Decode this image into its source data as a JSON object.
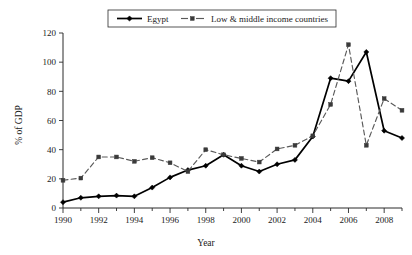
{
  "chart_data": {
    "type": "line",
    "title": "",
    "xlabel": "Year",
    "ylabel": "% of GDP",
    "xlim": [
      1990,
      2009
    ],
    "ylim": [
      0,
      120
    ],
    "ytick_step": 20,
    "yticks": [
      0,
      20,
      40,
      60,
      80,
      100,
      120
    ],
    "xticks": [
      1990,
      1991,
      1992,
      1993,
      1994,
      1995,
      1996,
      1997,
      1998,
      1999,
      2000,
      2001,
      2002,
      2003,
      2004,
      2005,
      2006,
      2007,
      2008,
      2009
    ],
    "xtick_labels": [
      "1990",
      "",
      "1992",
      "",
      "1994",
      "",
      "1996",
      "",
      "1998",
      "",
      "2000",
      "",
      "2002",
      "",
      "2004",
      "",
      "2006",
      "",
      "2008",
      ""
    ],
    "grid": false,
    "legend_position": "top-center",
    "x": [
      1990,
      1991,
      1992,
      1993,
      1994,
      1995,
      1996,
      1997,
      1998,
      1999,
      2000,
      2001,
      2002,
      2003,
      2004,
      2005,
      2006,
      2007,
      2008,
      2009
    ],
    "series": [
      {
        "name": "Egypt",
        "marker": "diamond",
        "linestyle": "solid",
        "color": "#000000",
        "values": [
          4,
          7,
          8,
          8.5,
          8,
          14,
          21,
          26,
          29,
          36.5,
          29,
          25,
          30,
          33,
          49,
          89,
          87,
          107,
          53,
          48
        ]
      },
      {
        "name": "Low & middle income countries",
        "marker": "square",
        "linestyle": "dashed",
        "color": "#5a5a5a",
        "values": [
          19,
          20.5,
          35,
          35,
          32,
          34.5,
          31,
          25,
          40,
          36.5,
          34,
          31.5,
          40.5,
          43,
          49.5,
          71,
          112,
          43,
          75,
          67
        ]
      }
    ]
  },
  "legend": {
    "items": [
      {
        "label": "Egypt"
      },
      {
        "label": "Low & middle income countries"
      }
    ]
  },
  "axes": {
    "y_title": "% of GDP",
    "x_title": "Year"
  }
}
